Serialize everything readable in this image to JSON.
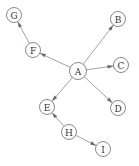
{
  "diagram": {
    "type": "directed-graph",
    "node_radius": 7.5,
    "colors": {
      "node_fill": "#ffffff",
      "node_stroke": "#7a7a7a",
      "edge": "#8a8a8a",
      "arrow": "#6a6a6a",
      "label": "#333333"
    },
    "nodes": [
      {
        "id": "A",
        "label": "A",
        "x": 78,
        "y": 71,
        "r": 8.5
      },
      {
        "id": "B",
        "label": "B",
        "x": 118,
        "y": 19,
        "r": 7.5
      },
      {
        "id": "C",
        "label": "C",
        "x": 121,
        "y": 65,
        "r": 7.5
      },
      {
        "id": "D",
        "label": "D",
        "x": 118,
        "y": 108,
        "r": 7.5
      },
      {
        "id": "E",
        "label": "E",
        "x": 47,
        "y": 107,
        "r": 7.5
      },
      {
        "id": "F",
        "label": "F",
        "x": 33,
        "y": 50,
        "r": 7.5
      },
      {
        "id": "G",
        "label": "G",
        "x": 14,
        "y": 15,
        "r": 7.5
      },
      {
        "id": "H",
        "label": "H",
        "x": 69,
        "y": 132,
        "r": 7.5
      },
      {
        "id": "I",
        "label": "I",
        "x": 103,
        "y": 149,
        "r": 7.5
      }
    ],
    "edges": [
      {
        "from": "A",
        "to": "B"
      },
      {
        "from": "A",
        "to": "C"
      },
      {
        "from": "A",
        "to": "D"
      },
      {
        "from": "A",
        "to": "E"
      },
      {
        "from": "A",
        "to": "F"
      },
      {
        "from": "F",
        "to": "G"
      },
      {
        "from": "H",
        "to": "E"
      },
      {
        "from": "H",
        "to": "I"
      }
    ]
  }
}
